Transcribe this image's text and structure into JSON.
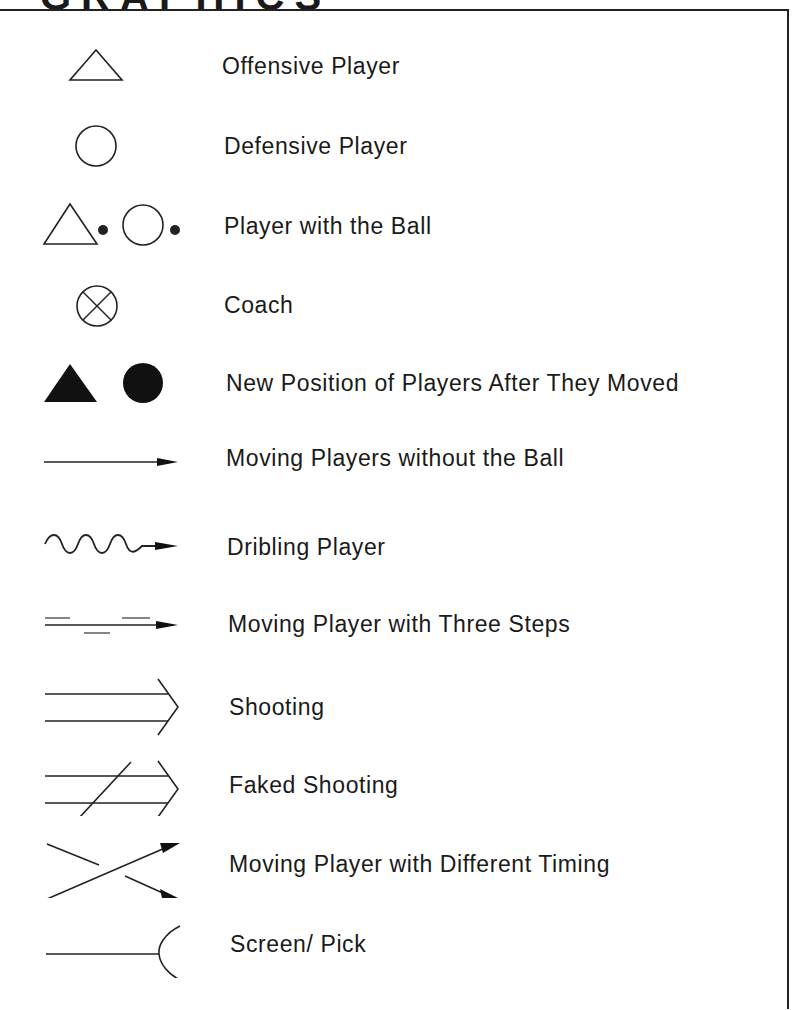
{
  "header": {
    "title_partial": "GRAPHICS"
  },
  "legend": {
    "items": [
      {
        "symbol": "open-triangle",
        "label": "Offensive Player"
      },
      {
        "symbol": "open-circle",
        "label": "Defensive Player"
      },
      {
        "symbol": "triangle-dot-circle-dot",
        "label": "Player with the Ball"
      },
      {
        "symbol": "circle-with-x",
        "label": "Coach"
      },
      {
        "symbol": "filled-triangle-filled-circle",
        "label": "New Position of Players After They Moved"
      },
      {
        "symbol": "straight-arrow",
        "label": "Moving Players without the Ball"
      },
      {
        "symbol": "wavy-arrow",
        "label": "Dribling Player"
      },
      {
        "symbol": "dashed-step-arrow",
        "label": "Moving Player with Three Steps"
      },
      {
        "symbol": "double-line-arrow",
        "label": "Shooting"
      },
      {
        "symbol": "double-line-arrow-slashed",
        "label": "Faked Shooting"
      },
      {
        "symbol": "crossing-arrows",
        "label": "Moving Player with Different Timing"
      },
      {
        "symbol": "line-with-arc",
        "label": "Screen/ Pick"
      }
    ]
  },
  "colors": {
    "ink": "#1a1a1a",
    "background": "#ffffff",
    "border": "#222222"
  }
}
